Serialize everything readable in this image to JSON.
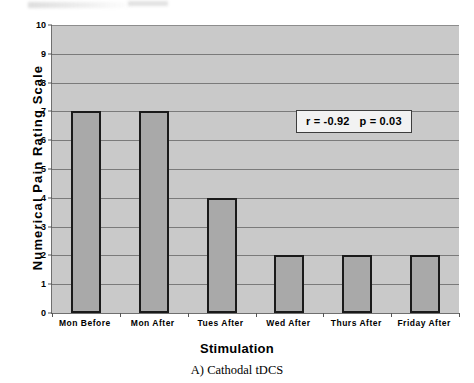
{
  "chart_data": {
    "type": "bar",
    "title": "",
    "categories": [
      "Mon Before",
      "Mon After",
      "Tues After",
      "Wed After",
      "Thurs After",
      "Friday After"
    ],
    "values": [
      7,
      7,
      4,
      2,
      2,
      2
    ],
    "xlabel": "Stimulation",
    "ylabel": "Numerical Pain Rating Scale",
    "ylim": [
      0,
      10
    ],
    "ytick_step": 1,
    "yticks": [
      "0",
      "1",
      "2",
      "3",
      "4",
      "5",
      "6",
      "7",
      "8",
      "9",
      "10"
    ],
    "grid": true,
    "legend": false,
    "annotations": [
      {
        "text": "r = -0.92   p = 0.03"
      }
    ],
    "colors": {
      "bar_fill": "#a9a9a9",
      "bar_border": "#1a1a1a",
      "plot_background": "#c9c9c9",
      "gridline": "#7a7a7a",
      "figure_background": "#ffffff",
      "text": "#000000"
    }
  },
  "caption": {
    "text": "A) Cathodal tDCS"
  }
}
